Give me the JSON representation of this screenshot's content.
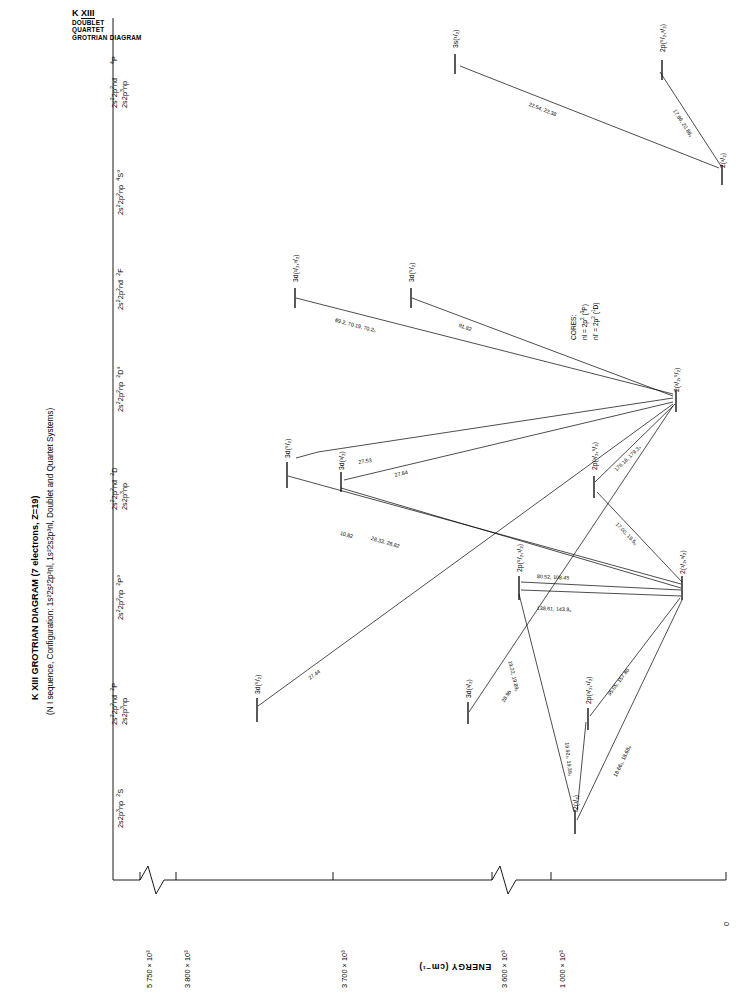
{
  "header": {
    "element_label": "K XIII",
    "sub_lines": [
      "DOUBLET",
      "QUARTET",
      "GROTRIAN DIAGRAM"
    ],
    "title": "K XIII  GROTRIAN DIAGRAM (7 electrons, Z=19)",
    "subtitle": "(N I sequence, Configuration: 1s²2s²2p²nl, 1s²2s2p³nl, Doublet and Quartet Systems)"
  },
  "axis": {
    "label": "ENERGY (cm⁻¹)",
    "ticks": [
      {
        "text": "5 750 × 10³",
        "value": 5750000
      },
      {
        "text": "3 800 × 10³",
        "value": 3800000
      },
      {
        "text": "3 700 × 10³",
        "value": 3700000
      },
      {
        "text": "3 600 × 10³",
        "value": 3600000
      },
      {
        "text": "1 000 × 10³",
        "value": 1000000
      },
      {
        "text": "0",
        "value": 0
      }
    ],
    "breaks": 2
  },
  "columns": [
    {
      "id": "col-4P",
      "config": "2s²2p²nd\n2s2p³np",
      "term": "⁴P"
    },
    {
      "id": "col-4So",
      "config": "2s²2p²np",
      "term": "⁴S°"
    },
    {
      "id": "col-2F",
      "config": "2s²2p²nd",
      "term": "²F"
    },
    {
      "id": "col-2Do",
      "config": "2s²2p²np",
      "term": "²D°"
    },
    {
      "id": "col-2D",
      "config": "2s²2p²nd\n2s2p³np",
      "term": "²D"
    },
    {
      "id": "col-2Po",
      "config": "2s²2p²np",
      "term": "²P°"
    },
    {
      "id": "col-2P",
      "config": "2s²2p²nd\n2s2p³np",
      "term": "²P"
    },
    {
      "id": "col-2S",
      "config": "2s2p³np",
      "term": "²S"
    }
  ],
  "cores": {
    "title": "CORES:",
    "lines": [
      "nl = 2p² (³P)",
      "nl' = 2p² (¹D)"
    ]
  },
  "levels": [
    {
      "id": "lvl-3s-1half-a",
      "label": "3s(¹/₂)",
      "x": 458,
      "y": 48
    },
    {
      "id": "lvl-2p-5half-3half",
      "label": "2p(⁵/₂,³/₂)",
      "x": 655,
      "y": 55
    },
    {
      "id": "lvl-2-3half-a",
      "label": "2(³/₂)",
      "x": 722,
      "y": 172
    },
    {
      "id": "lvl-3d-1half-3half",
      "label": "3d(¹/₂,³/₂)",
      "x": 300,
      "y": 282
    },
    {
      "id": "lvl-3d-5half",
      "label": "3d(⁵/₂)",
      "x": 414,
      "y": 283
    },
    {
      "id": "lvl-2-3half-5half",
      "label": "2(³/₂,⁵/₂)",
      "x": 676,
      "y": 396
    },
    {
      "id": "lvl-3d-5half-b",
      "label": "3d(⁵/₂)",
      "x": 288,
      "y": 458
    },
    {
      "id": "lvl-3d-3half",
      "label": "3d(³/₂)",
      "x": 340,
      "y": 470
    },
    {
      "id": "lvl-2p-3half-5half",
      "label": "2p(³/₂,⁵/₂)",
      "x": 595,
      "y": 470
    },
    {
      "id": "lvl-2p-5half-1half",
      "label": "2p(⁵/₂,¹/₂)",
      "x": 519,
      "y": 570
    },
    {
      "id": "lvl-2-1half-3half",
      "label": "2(¹/₂,³/₂)",
      "x": 683,
      "y": 580
    },
    {
      "id": "lvl-3d-5half-c",
      "label": "3d(⁵/₂)",
      "x": 257,
      "y": 693
    },
    {
      "id": "lvl-3d-3half-b",
      "label": "3d(³/₂)",
      "x": 467,
      "y": 697
    },
    {
      "id": "lvl-2p-3half-1half",
      "label": "2p(³/₂,¹/₂)",
      "x": 588,
      "y": 704
    },
    {
      "id": "lvl-2-1half",
      "label": "2(¹/₂)",
      "x": 572,
      "y": 816
    }
  ],
  "transitions": [
    {
      "id": "tr-1",
      "wavelength": "22.54, 22.38",
      "x1": 462,
      "y1": 58,
      "x2": 718,
      "y2": 166
    },
    {
      "id": "tr-2",
      "wavelength": "17.86, 20.88₃",
      "x1": 655,
      "y1": 66,
      "x2": 720,
      "y2": 164
    },
    {
      "id": "tr-3",
      "wavelength": "69.2, 70.19, 70.2₀",
      "x1": 296,
      "y1": 292,
      "x2": 672,
      "y2": 392
    },
    {
      "id": "tr-4",
      "wavelength": "91.82",
      "x1": 412,
      "y1": 292,
      "x2": 672,
      "y2": 392
    },
    {
      "id": "tr-5",
      "wavelength": "27.53",
      "x1": 318,
      "y1": 460,
      "x2": 672,
      "y2": 398
    },
    {
      "id": "tr-6",
      "wavelength": "27.84",
      "x1": 344,
      "y1": 478,
      "x2": 672,
      "y2": 400
    },
    {
      "id": "tr-7",
      "wavelength": "10.82",
      "x1": 288,
      "y1": 468,
      "x2": 680,
      "y2": 582
    },
    {
      "id": "tr-8",
      "wavelength": "28.33, 28.82",
      "x1": 340,
      "y1": 480,
      "x2": 680,
      "y2": 586
    },
    {
      "id": "tr-9",
      "wavelength": "27.44",
      "x1": 258,
      "y1": 700,
      "x2": 672,
      "y2": 402
    },
    {
      "id": "tr-10",
      "wavelength": "28.96",
      "x1": 468,
      "y1": 706,
      "x2": 672,
      "y2": 404
    },
    {
      "id": "tr-11",
      "wavelength": "176.18, 179.3₃",
      "x1": 594,
      "y1": 478,
      "x2": 674,
      "y2": 398
    },
    {
      "id": "tr-12",
      "wavelength": "17.00, 19.5₀",
      "x1": 596,
      "y1": 480,
      "x2": 681,
      "y2": 578
    },
    {
      "id": "tr-13",
      "wavelength": "80.52, 108.45",
      "x1": 520,
      "y1": 578,
      "x2": 680,
      "y2": 588
    },
    {
      "id": "tr-14",
      "wavelength": "138.61, 143.8₆",
      "x1": 521,
      "y1": 582,
      "x2": 680,
      "y2": 592
    },
    {
      "id": "tr-15",
      "wavelength": "19.22, 19.89₂",
      "x1": 518,
      "y1": 580,
      "x2": 575,
      "y2": 810
    },
    {
      "id": "tr-16",
      "wavelength": "19.92₅, 19.39₃",
      "x1": 585,
      "y1": 710,
      "x2": 577,
      "y2": 812
    },
    {
      "id": "tr-17",
      "wavelength": "95.05, 157.86",
      "x1": 590,
      "y1": 712,
      "x2": 679,
      "y2": 592
    },
    {
      "id": "tr-18",
      "wavelength": "18.66₃, 18.68₉",
      "x1": 576,
      "y1": 812,
      "x2": 681,
      "y2": 594
    }
  ]
}
